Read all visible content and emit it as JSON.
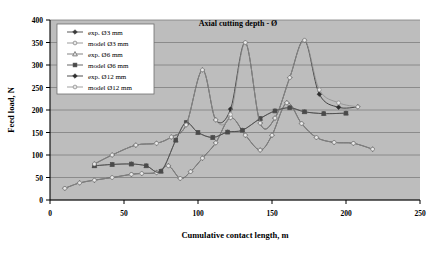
{
  "chart_data": {
    "type": "line",
    "title": "Axial cutting depth - Ø",
    "xlabel": "Cumulative contact length, m",
    "ylabel": "Feed load, N",
    "xlim": [
      0,
      250
    ],
    "ylim": [
      0,
      400
    ],
    "xticks": [
      0,
      50,
      100,
      150,
      200,
      250
    ],
    "yticks": [
      0,
      50,
      100,
      150,
      200,
      250,
      300,
      350,
      400
    ],
    "grid": "horizontal",
    "legend_position": "top-left-inside",
    "plot_background": "#bdbdbd",
    "series": [
      {
        "name": "exp. Ø3 mm",
        "marker": "filled-diamond",
        "color": "#3a3a3a",
        "x": [
          10,
          20,
          30,
          42,
          55,
          62,
          72,
          80,
          88,
          95,
          103,
          112,
          122,
          132,
          142,
          150,
          160,
          170,
          180,
          192,
          205,
          218
        ],
        "y": [
          26,
          38,
          44,
          50,
          57,
          59,
          61,
          76,
          48,
          63,
          93,
          127,
          183,
          144,
          111,
          144,
          216,
          170,
          139,
          128,
          126,
          113
        ]
      },
      {
        "name": "model Ø3 mm",
        "marker": "open-circle",
        "color": "#8a8a8a",
        "x": [
          10,
          20,
          30,
          42,
          55,
          62,
          72,
          80,
          88,
          95,
          103,
          112,
          122,
          132,
          142,
          150,
          160,
          170,
          180,
          192,
          205,
          218
        ],
        "y": [
          26,
          38,
          44,
          50,
          57,
          59,
          61,
          76,
          48,
          63,
          93,
          127,
          183,
          144,
          111,
          144,
          216,
          170,
          139,
          128,
          126,
          113
        ]
      },
      {
        "name": "exp. Ø6 mm",
        "marker": "open-triangle",
        "color": "#6e6e6e",
        "x": [
          30,
          42,
          55,
          65,
          75,
          85,
          92,
          100,
          110,
          120,
          130,
          142,
          152,
          162,
          172,
          185,
          200
        ],
        "y": [
          76,
          79,
          80,
          76,
          64,
          133,
          172,
          150,
          139,
          151,
          155,
          181,
          198,
          205,
          196,
          192,
          193
        ]
      },
      {
        "name": "model Ø6 mm",
        "marker": "filled-square",
        "color": "#4a4a4a",
        "x": [
          30,
          42,
          55,
          65,
          75,
          85,
          92,
          100,
          110,
          120,
          130,
          142,
          152,
          162,
          172,
          185,
          200
        ],
        "y": [
          76,
          79,
          80,
          76,
          64,
          133,
          172,
          150,
          139,
          151,
          155,
          181,
          198,
          205,
          196,
          192,
          193
        ]
      },
      {
        "name": "exp. Ø12 mm",
        "marker": "filled-diamond",
        "color": "#2e2e2e",
        "x": [
          30,
          42,
          58,
          72,
          82,
          92,
          103,
          112,
          122,
          132,
          142,
          152,
          162,
          172,
          182,
          195,
          208
        ],
        "y": [
          80,
          100,
          122,
          126,
          140,
          167,
          289,
          178,
          202,
          350,
          171,
          182,
          272,
          355,
          235,
          206,
          207
        ]
      },
      {
        "name": "model Ø12 mm",
        "marker": "open-circle",
        "color": "#909090",
        "x": [
          30,
          42,
          58,
          72,
          82,
          92,
          103,
          112,
          122,
          132,
          142,
          152,
          162,
          172,
          182,
          195,
          208
        ],
        "y": [
          80,
          100,
          122,
          126,
          140,
          167,
          289,
          178,
          190,
          350,
          171,
          182,
          272,
          355,
          245,
          216,
          207
        ]
      }
    ]
  },
  "legend": {
    "items": [
      {
        "label": "exp. Ø3 mm"
      },
      {
        "label": "model Ø3 mm"
      },
      {
        "label": "exp. Ø6 mm"
      },
      {
        "label": "model Ø6 mm"
      },
      {
        "label": "exp. Ø12 mm"
      },
      {
        "label": "model Ø12 mm"
      }
    ]
  }
}
